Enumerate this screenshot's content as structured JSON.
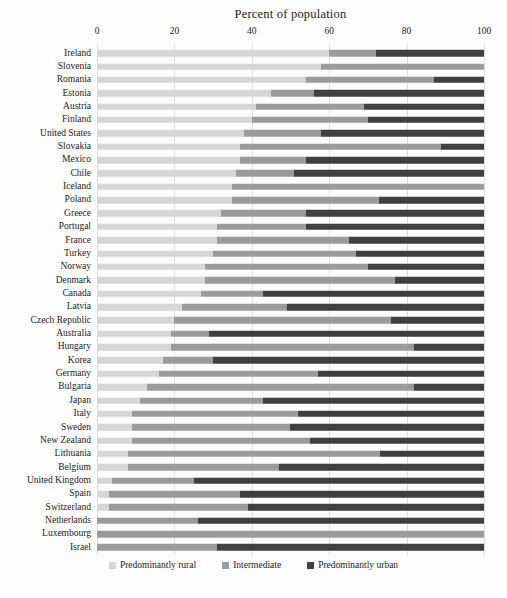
{
  "chart_data": {
    "type": "bar",
    "stacked": true,
    "orientation": "horizontal",
    "title": "Percent of population",
    "xlim": [
      0,
      100
    ],
    "x_ticks": [
      0,
      20,
      40,
      60,
      80,
      100
    ],
    "grid": true,
    "legend_position": "bottom",
    "categories": [
      "Ireland",
      "Slovenia",
      "Romania",
      "Estonia",
      "Austria",
      "Finland",
      "United States",
      "Slovakia",
      "Mexico",
      "Chile",
      "Iceland",
      "Poland",
      "Greece",
      "Portugal",
      "France",
      "Turkey",
      "Norway",
      "Denmark",
      "Canada",
      "Latvia",
      "Czech Republic",
      "Australia",
      "Hungary",
      "Korea",
      "Germany",
      "Bulgaria",
      "Japan",
      "Italy",
      "Sweden",
      "New Zealand",
      "Lithuania",
      "Belgium",
      "United Kingdom",
      "Spain",
      "Switzerland",
      "Netherlands",
      "Luxembourg",
      "Israel"
    ],
    "series": [
      {
        "key": "rural",
        "name": "Predominantly rural",
        "color": "#d6d6d4",
        "values": [
          60,
          58,
          54,
          45,
          41,
          40,
          38,
          37,
          37,
          36,
          35,
          35,
          32,
          31,
          31,
          30,
          28,
          28,
          27,
          22,
          20,
          19,
          19,
          17,
          16,
          13,
          11,
          9,
          9,
          9,
          8,
          8,
          4,
          3,
          3,
          0,
          0,
          0
        ]
      },
      {
        "key": "intermediate",
        "name": "Intermediate",
        "color": "#9b9b99",
        "values": [
          12,
          42,
          33,
          11,
          28,
          30,
          20,
          52,
          17,
          15,
          65,
          38,
          22,
          23,
          34,
          37,
          42,
          49,
          16,
          27,
          56,
          10,
          63,
          13,
          41,
          69,
          32,
          43,
          41,
          46,
          65,
          39,
          21,
          34,
          36,
          26,
          100,
          31
        ]
      },
      {
        "key": "urban",
        "name": "Predominantly urban",
        "color": "#404040",
        "values": [
          28,
          0,
          13,
          44,
          31,
          30,
          42,
          11,
          46,
          49,
          0,
          27,
          46,
          46,
          35,
          33,
          30,
          23,
          57,
          51,
          24,
          71,
          18,
          70,
          43,
          18,
          57,
          48,
          50,
          45,
          27,
          53,
          75,
          63,
          61,
          74,
          0,
          69
        ]
      }
    ]
  }
}
